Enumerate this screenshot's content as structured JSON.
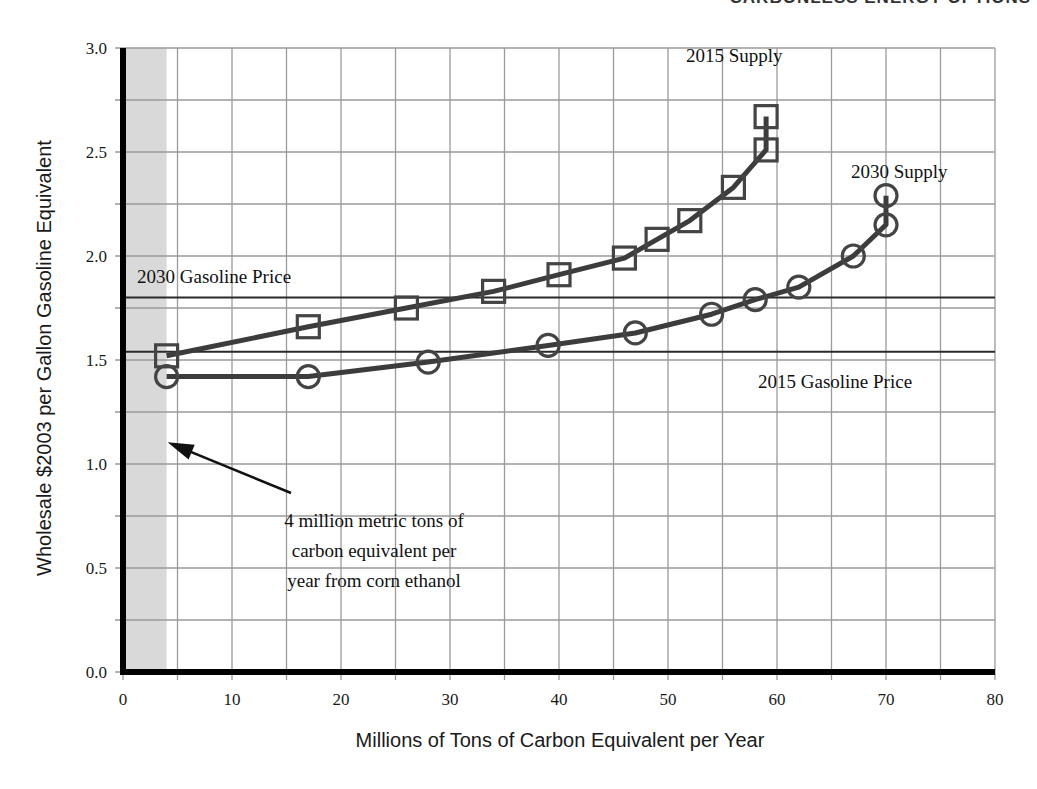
{
  "page": {
    "header": "CARBONLESS ENERGY OPTIONS"
  },
  "chart_data": {
    "type": "line",
    "title": "",
    "xlabel": "Millions of Tons of Carbon Equivalent per Year",
    "ylabel": "Wholesale $2003 per Gallon Gasoline Equivalent",
    "xlim": [
      0,
      80
    ],
    "ylim": [
      0,
      3.0
    ],
    "x_ticks": [
      "0",
      "10",
      "20",
      "30",
      "40",
      "50",
      "60",
      "70",
      "80"
    ],
    "y_ticks": [
      "0.0",
      "0.5",
      "1.0",
      "1.5",
      "2.0",
      "2.5",
      "3.0"
    ],
    "grid": true,
    "grid_x_step": 5,
    "grid_y_step": 0.25,
    "shaded_region": {
      "x_from": 0,
      "x_to": 4,
      "color": "#d9d9d9"
    },
    "series": [
      {
        "name": "2015 Supply",
        "marker": "square",
        "x": [
          4,
          17,
          26,
          34,
          40,
          46,
          49,
          52,
          56,
          59,
          59
        ],
        "y": [
          1.52,
          1.66,
          1.75,
          1.83,
          1.91,
          1.99,
          2.08,
          2.17,
          2.33,
          2.51,
          2.67
        ]
      },
      {
        "name": "2030 Supply",
        "marker": "circle",
        "x": [
          4,
          17,
          28,
          39,
          47,
          54,
          58,
          62,
          67,
          70,
          70
        ],
        "y": [
          1.42,
          1.42,
          1.49,
          1.57,
          1.63,
          1.72,
          1.79,
          1.85,
          2.0,
          2.15,
          2.29
        ]
      }
    ],
    "reference_lines": [
      {
        "name": "2030 Gasoline Price",
        "y": 1.8
      },
      {
        "name": "2015 Gasoline Price",
        "y": 1.54
      }
    ],
    "annotations": [
      {
        "text_lines": [
          "4 million metric tons of",
          "carbon equivalent per",
          "year from corn ethanol"
        ],
        "arrow_to": {
          "x": 4,
          "y": 1.1
        }
      }
    ],
    "labels": {
      "supply_2015": "2015 Supply",
      "supply_2030": "2030 Supply",
      "gas_2030": "2030 Gasoline Price",
      "gas_2015": "2015 Gasoline Price"
    }
  }
}
